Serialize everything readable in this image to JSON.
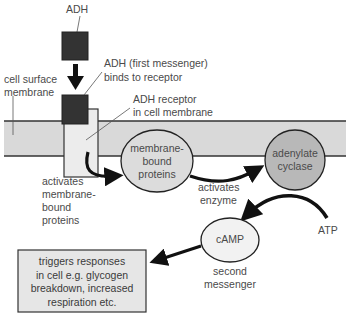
{
  "diagram": {
    "labels": {
      "adh": "ADH",
      "adh_binds_line1": "ADH (first messenger)",
      "adh_binds_line2": "binds to receptor",
      "cell_membrane_line1": "cell surface",
      "cell_membrane_line2": "membrane",
      "receptor_line1": "ADH receptor",
      "receptor_line2": "in cell membrane",
      "activates_mbp_line1": "activates",
      "activates_mbp_line2": "membrane-",
      "activates_mbp_line3": "bound",
      "activates_mbp_line4": "proteins",
      "activates_enzyme_line1": "activates",
      "activates_enzyme_line2": "enzyme",
      "atp": "ATP",
      "second_messenger_line1": "second",
      "second_messenger_line2": "messenger"
    },
    "nodes": {
      "membrane_bound_proteins": [
        "membrane-",
        "bound",
        "proteins"
      ],
      "adenylate_cyclase": [
        "adenylate",
        "cyclase"
      ],
      "camp": "cAMP",
      "response_box": [
        "triggers responses",
        "in cell e.g. glycogen",
        "breakdown, increased",
        "respiration etc."
      ]
    },
    "colors": {
      "membrane_fill": "#d9d9d9",
      "adh_block": "#333333",
      "receptor_fill": "#ececec",
      "mbp_fill": "#dcdcdc",
      "adenylate_fill": "#b8b8b8",
      "camp_fill": "#f2f2f2",
      "box_fill": "#e6e6e6",
      "stroke": "#222222"
    }
  }
}
